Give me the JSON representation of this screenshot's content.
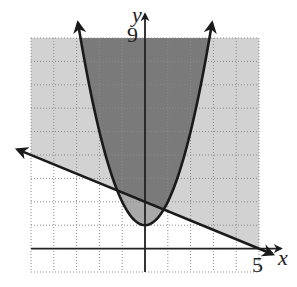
{
  "chart_data": {
    "type": "line",
    "title": "",
    "xlabel": "x",
    "ylabel": "y",
    "xlim": [
      -5,
      5
    ],
    "ylim": [
      -1,
      9
    ],
    "grid": true,
    "grid_style": "dotted",
    "tick_labels": {
      "x": [
        {
          "value": 5,
          "label": "5"
        }
      ],
      "y": [
        {
          "value": 9,
          "label": "9"
        }
      ]
    },
    "series": [
      {
        "name": "parabola",
        "equation": "y = x^2 + 1",
        "kind": "quadratic",
        "a": 1,
        "b": 0,
        "c": 1,
        "vertex": [
          0,
          1
        ],
        "arrows": "both ends",
        "shading": "inside (y >= x^2 + 1)"
      },
      {
        "name": "line",
        "equation": "y = -2/5 x + 2",
        "kind": "linear",
        "slope": -0.4,
        "intercept": 2,
        "arrows": "both ends",
        "shading": "above (y >= -0.4x + 2)"
      }
    ],
    "regions": [
      {
        "name": "above-line-only",
        "color": "#d2d2d2"
      },
      {
        "name": "inside-parabola-only",
        "color": "#a9a9a9"
      },
      {
        "name": "overlap",
        "color": "#7a7a7a"
      }
    ],
    "intersections": [
      [
        -1.6,
        2.64
      ],
      [
        1.2,
        1.52
      ]
    ]
  },
  "colors": {
    "light": "#d2d2d2",
    "medium": "#a9a9a9",
    "dark": "#7a7a7a",
    "grid": "#8a8a8a",
    "axis": "#222222",
    "curve": "#1a1a1a"
  }
}
